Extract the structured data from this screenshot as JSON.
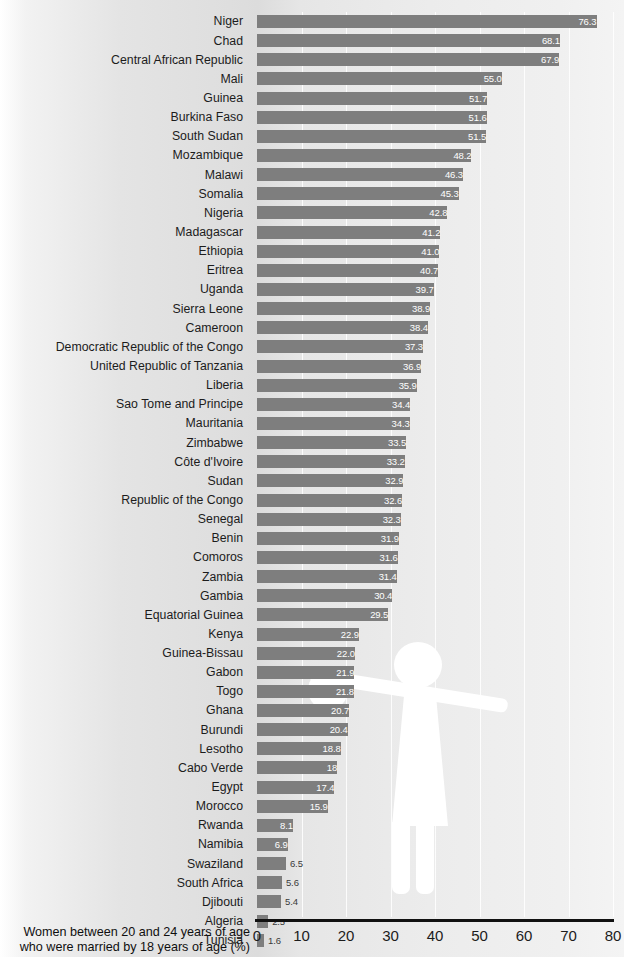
{
  "chart_data": {
    "type": "bar",
    "orientation": "horizontal",
    "title": "",
    "subtitle": "",
    "xlabel": "Women between 20 and 24 years of age who were married by 18 years of age (%)",
    "ylabel": "",
    "xlim": [
      0,
      80
    ],
    "xticks": [
      0,
      10,
      20,
      30,
      40,
      50,
      60,
      70,
      80
    ],
    "xtick_labels": [
      "0",
      "10",
      "20",
      "30",
      "40",
      "50",
      "60",
      "70",
      "80"
    ],
    "grid": true,
    "grid_axis": "x",
    "legend": false,
    "bar_color": "#7e7e7e",
    "categories": [
      "Niger",
      "Chad",
      "Central African Republic",
      "Mali",
      "Guinea",
      "Burkina Faso",
      "South Sudan",
      "Mozambique",
      "Malawi",
      "Somalia",
      "Nigeria",
      "Madagascar",
      "Ethiopia",
      "Eritrea",
      "Uganda",
      "Sierra Leone",
      "Cameroon",
      "Democratic Republic of the Congo",
      "United Republic of Tanzania",
      "Liberia",
      "Sao Tome and Principe",
      "Mauritania",
      "Zimbabwe",
      "Côte d'Ivoire",
      "Sudan",
      "Republic of the Congo",
      "Senegal",
      "Benin",
      "Comoros",
      "Zambia",
      "Gambia",
      "Equatorial Guinea",
      "Kenya",
      "Guinea-Bissau",
      "Gabon",
      "Togo",
      "Ghana",
      "Burundi",
      "Lesotho",
      "Cabo Verde",
      "Egypt",
      "Morocco",
      "Rwanda",
      "Namibia",
      "Swaziland",
      "South Africa",
      "Djibouti",
      "Algeria",
      "Tunisia"
    ],
    "values": [
      76.3,
      68.1,
      67.9,
      55.0,
      51.7,
      51.6,
      51.5,
      48.2,
      46.3,
      45.3,
      42.8,
      41.2,
      41.0,
      40.7,
      39.7,
      38.9,
      38.4,
      37.3,
      36.9,
      35.9,
      34.4,
      34.3,
      33.5,
      33.2,
      32.9,
      32.6,
      32.3,
      31.9,
      31.6,
      31.4,
      30.4,
      29.5,
      22.9,
      22.0,
      21.9,
      21.8,
      20.7,
      20.4,
      18.8,
      18.0,
      17.4,
      15.9,
      8.1,
      6.9,
      6.5,
      5.6,
      5.4,
      2.5,
      1.6
    ],
    "value_labels": [
      "76.3",
      "68.1",
      "67.9",
      "55.0",
      "51.7",
      "51.6",
      "51.5",
      "48.2",
      "46.3",
      "45.3",
      "42.8",
      "41.2",
      "41.0",
      "40.7",
      "39.7",
      "38.9",
      "38.4",
      "37.3",
      "36.9",
      "35.9",
      "34.4",
      "34.3",
      "33.5",
      "33.2",
      "32.9",
      "32.6",
      "32.3",
      "31.9",
      "31.6",
      "31.4",
      "30.4",
      "29.5",
      "22.9",
      "22.0",
      "21.9",
      "21.8",
      "20.7",
      "20.4",
      "18.8",
      "18",
      "17.4",
      "15.9",
      "8.1",
      "6.9",
      "6.5",
      "5.6",
      "5.4",
      "2.5",
      "1.6"
    ]
  },
  "caption": {
    "line1": "Women between 20 and 24 years of age",
    "line2": "who were married by 18 years of age (%)"
  }
}
